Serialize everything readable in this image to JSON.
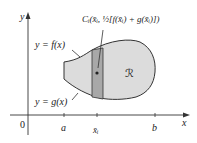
{
  "axes": {
    "y_label": "y",
    "x_label": "x",
    "origin_label": "0",
    "ticks": [
      {
        "label": "a"
      },
      {
        "label": "x̄ᵢ"
      },
      {
        "label": "b"
      }
    ]
  },
  "curves": {
    "upper": "y = f(x)",
    "lower": "y = g(x)"
  },
  "region_label": "ℛ",
  "point_label": "Cᵢ(x̄ᵢ, ½[f(x̄ᵢ) + g(x̄ᵢ)])",
  "colors": {
    "region_fill": "#dcdcdc",
    "strip_fill": "#a8a8a8",
    "outline": "#333333"
  }
}
